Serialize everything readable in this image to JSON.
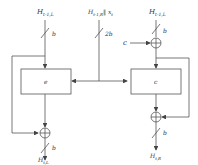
{
  "diagram": {
    "inputs": {
      "left": "H",
      "left_sub": "t-1,L",
      "center": "H",
      "center_sub": "t-1,R",
      "center_suffix": "‖ x",
      "center_suffix_sub": "t",
      "right": "H",
      "right_sub": "t-1,L",
      "side_input": "c"
    },
    "bus_widths": {
      "left_in": "b",
      "center_in": "2b",
      "right_in": "b",
      "left_out": "b",
      "right_out": "b"
    },
    "blocks": {
      "left": "e",
      "right": "c"
    },
    "outputs": {
      "left": "H",
      "left_sub": "t,L",
      "right": "H",
      "right_sub": "t,R"
    },
    "colors": {
      "line": "#555555",
      "box_fill": "#ffffff"
    }
  }
}
